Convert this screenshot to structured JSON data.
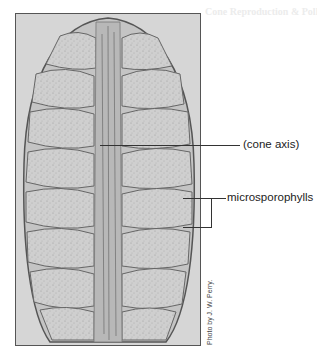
{
  "figure": {
    "background_color": "#d6d6d6",
    "border_color": "#555555"
  },
  "labels": {
    "cone_axis": "(cone axis)",
    "microsporophylls": "microsporophylls"
  },
  "credit": "Photo by J. W. Perry.",
  "bleed_through": {
    "heading": "Cone Reproduction & Pollen Cones"
  }
}
